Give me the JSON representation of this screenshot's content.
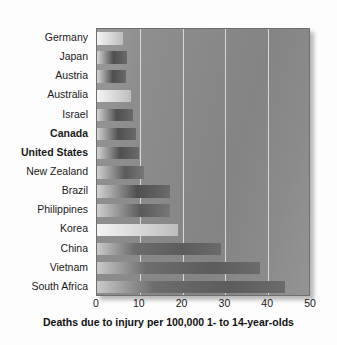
{
  "chart_data": {
    "type": "bar",
    "orientation": "horizontal",
    "title": "",
    "subtitle": "",
    "xlabel": "Deaths due to injury per 100,000 1- to 14-year-olds",
    "ylabel": "",
    "xlim": [
      0,
      50
    ],
    "xticks": [
      0,
      10,
      20,
      30,
      40,
      50
    ],
    "xtick_labels": [
      "0",
      "10",
      "20",
      "30",
      "40",
      "50"
    ],
    "grid": "vertical",
    "legend": "none",
    "categories": [
      "Germany",
      "Japan",
      "Austria",
      "Australia",
      "Israel",
      "Canada",
      "United States",
      "New Zealand",
      "Brazil",
      "Philippines",
      "Korea",
      "China",
      "Vietnam",
      "South Africa"
    ],
    "values": [
      6,
      7,
      6.8,
      8,
      8.5,
      9,
      9.8,
      11,
      17,
      17,
      19,
      29,
      38,
      44
    ],
    "emphasized": [
      "Canada",
      "United States"
    ],
    "bars": [
      {
        "label": "Germany",
        "value": 6,
        "style": "pale",
        "bold": false
      },
      {
        "label": "Japan",
        "value": 7,
        "style": "dark",
        "bold": false
      },
      {
        "label": "Austria",
        "value": 6.8,
        "style": "dark",
        "bold": false
      },
      {
        "label": "Australia",
        "value": 8,
        "style": "pale",
        "bold": false
      },
      {
        "label": "Israel",
        "value": 8.5,
        "style": "dark",
        "bold": false
      },
      {
        "label": "Canada",
        "value": 9,
        "style": "dark",
        "bold": true
      },
      {
        "label": "United States",
        "value": 9.8,
        "style": "dark",
        "bold": true
      },
      {
        "label": "New Zealand",
        "value": 11,
        "style": "mid",
        "bold": false
      },
      {
        "label": "Brazil",
        "value": 17,
        "style": "dark",
        "bold": false
      },
      {
        "label": "Philippines",
        "value": 17,
        "style": "mid",
        "bold": false
      },
      {
        "label": "Korea",
        "value": 19,
        "style": "pale",
        "bold": false
      },
      {
        "label": "China",
        "value": 29,
        "style": "long",
        "bold": false
      },
      {
        "label": "Vietnam",
        "value": 38,
        "style": "long",
        "bold": false
      },
      {
        "label": "South Africa",
        "value": 44,
        "style": "long",
        "bold": false
      }
    ]
  },
  "colors": {
    "plot_background": "#8a8a8a",
    "gridline": "#d8d8d8",
    "axis_border": "#6f6f6f",
    "text": "#1a1a1a",
    "page_background": "#fdfdfd"
  }
}
